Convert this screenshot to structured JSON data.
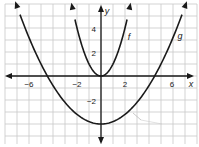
{
  "chart_data": {
    "type": "line",
    "title": "",
    "xlabel": "x",
    "ylabel": "y",
    "xlim": [
      -8,
      8
    ],
    "ylim": [
      -6,
      6
    ],
    "grid": true,
    "x_ticks": [
      -6,
      -2,
      2,
      6
    ],
    "y_ticks": [
      4,
      2,
      -2
    ],
    "x_tick_labels": [
      "−6",
      "−2",
      "2",
      "6"
    ],
    "y_tick_labels": [
      "4",
      "2",
      "−2"
    ],
    "series": [
      {
        "name": "f",
        "expression": "f(x) = x^2",
        "x": [
          -2.4,
          -2,
          -1,
          0,
          1,
          2,
          2.4
        ],
        "values": [
          5.76,
          4,
          1,
          0,
          1,
          4,
          5.76
        ]
      },
      {
        "name": "g",
        "expression": "g(x) = (1/5)x^2 - 4",
        "x": [
          -7.2,
          -6,
          -4.47,
          -2,
          0,
          2,
          4.47,
          6,
          7.2
        ],
        "values": [
          6.37,
          3.2,
          0,
          -3.2,
          -4,
          -3.2,
          0,
          3.2,
          6.37
        ]
      }
    ],
    "legend": [
      "f",
      "g"
    ],
    "annotations": [
      "f",
      "g"
    ]
  },
  "labels": {
    "x_axis": "x",
    "y_axis": "y",
    "f_label": "f",
    "g_label": "g",
    "xt": [
      "−6",
      "−2",
      "2",
      "6"
    ],
    "yt": [
      "4",
      "2",
      "−2"
    ]
  },
  "colors": {
    "curve": "#1a1a1a",
    "grid": "#c8c8c8",
    "axis": "#1a1a1a"
  }
}
